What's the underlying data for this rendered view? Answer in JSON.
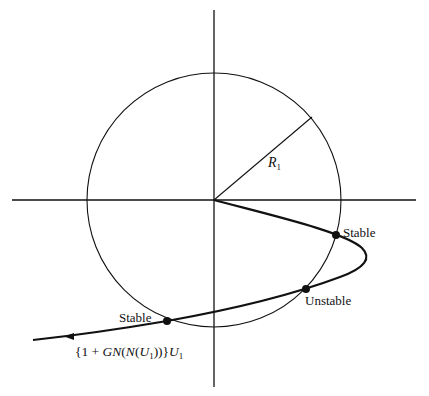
{
  "diagram": {
    "type": "describing-function stability plot",
    "axes": {
      "horizontal": "real axis",
      "vertical": "imaginary axis"
    },
    "circle": {
      "radius_label": "R",
      "radius_subscript": "1"
    },
    "curve": {
      "label_prefix": "{1 + ",
      "label_G": "GN",
      "label_mid": "(",
      "label_N": "N",
      "label_paren": "(",
      "label_U": "U",
      "label_sub1": "1",
      "label_close": "))}",
      "label_U2": "U",
      "label_sub2": "1"
    },
    "points": [
      {
        "label": "Stable"
      },
      {
        "label": "Unstable"
      },
      {
        "label": "Stable"
      }
    ],
    "colors": {
      "ink": "#111111",
      "background": "#ffffff"
    }
  }
}
